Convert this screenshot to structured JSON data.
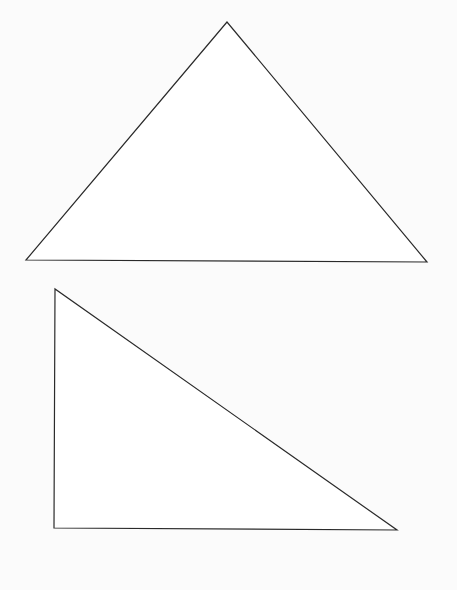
{
  "canvas": {
    "width": 457,
    "height": 590,
    "background": "#fbfbfb"
  },
  "stroke_color": "#2a2a2a",
  "fill_color": "#ffffff",
  "shapes": [
    {
      "name": "triangle-acute-isosceles",
      "points": [
        [
          227,
          22
        ],
        [
          26,
          260
        ],
        [
          427,
          262
        ]
      ]
    },
    {
      "name": "triangle-right",
      "points": [
        [
          55,
          289
        ],
        [
          54,
          528
        ],
        [
          397,
          530
        ]
      ]
    }
  ]
}
